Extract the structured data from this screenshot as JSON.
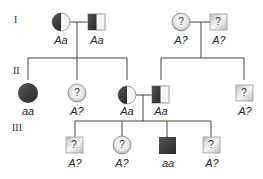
{
  "colors": {
    "affected": "#3a3a3a",
    "unknown_fill": "#e8e8e8",
    "line": "#444444"
  },
  "generations": [
    {
      "label": "I"
    },
    {
      "label": "II"
    },
    {
      "label": "III"
    }
  ],
  "individuals": {
    "I1": {
      "sex": "female",
      "status": "carrier",
      "genotype": "Aa"
    },
    "I2": {
      "sex": "male",
      "status": "carrier",
      "genotype": "Aa"
    },
    "I3": {
      "sex": "female",
      "status": "unknown",
      "symbol": "?",
      "genotype": "A?"
    },
    "I4": {
      "sex": "male",
      "status": "unknown",
      "symbol": "?",
      "genotype": "A?"
    },
    "II1": {
      "sex": "female",
      "status": "affected",
      "genotype": "aa"
    },
    "II2": {
      "sex": "female",
      "status": "unknown",
      "symbol": "?",
      "genotype": "A?"
    },
    "II3": {
      "sex": "female",
      "status": "carrier",
      "genotype": "Aa"
    },
    "II4": {
      "sex": "male",
      "status": "carrier",
      "genotype": "Aa"
    },
    "II5": {
      "sex": "male",
      "status": "unknown",
      "symbol": "?",
      "genotype": "A?"
    },
    "III1": {
      "sex": "male",
      "status": "unknown",
      "symbol": "?",
      "genotype": "A?"
    },
    "III2": {
      "sex": "female",
      "status": "unknown",
      "symbol": "?",
      "genotype": "A?"
    },
    "III3": {
      "sex": "male",
      "status": "affected",
      "genotype": "aa"
    },
    "III4": {
      "sex": "male",
      "status": "unknown",
      "symbol": "?",
      "genotype": "A?"
    }
  }
}
